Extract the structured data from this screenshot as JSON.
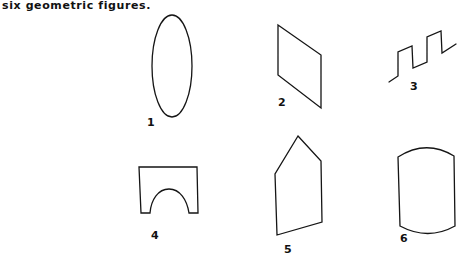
{
  "caption": "six geometric figures.",
  "figures": [
    {
      "number": "1",
      "shape": "vertical ellipse"
    },
    {
      "number": "2",
      "shape": "parallelogram"
    },
    {
      "number": "3",
      "shape": "square-wave zigzag line"
    },
    {
      "number": "4",
      "shape": "rectangle with semicircular arch cut-out"
    },
    {
      "number": "5",
      "shape": "irregular pentagon (house shape)"
    },
    {
      "number": "6",
      "shape": "rectangle with curved top and bottom"
    }
  ]
}
